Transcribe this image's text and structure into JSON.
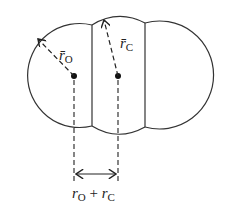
{
  "diagram": {
    "labels": {
      "oxygen_radius": "r̄",
      "oxygen_radius_sub": "O",
      "carbon_radius": "r̄",
      "carbon_radius_sub": "C",
      "bond_r1": "r",
      "bond_r1_sub": "O",
      "bond_plus": " + ",
      "bond_r2": "r",
      "bond_r2_sub": "C"
    },
    "colors": {
      "stroke": "#333333",
      "background": "#ffffff"
    }
  }
}
